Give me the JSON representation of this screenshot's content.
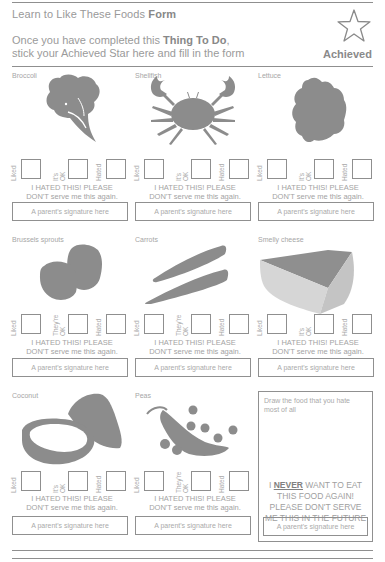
{
  "header": {
    "title_prefix": "Learn to Like These Foods",
    "title_bold": "Form",
    "instruction_line1_prefix": "Once you have completed this",
    "instruction_line1_bold": "Thing To Do",
    "instruction_line1_suffix": ",",
    "instruction_line2": "stick your Achieved Star here and fill in the form",
    "achieved_label": "Achieved",
    "star_icon": "star-outline-icon"
  },
  "common": {
    "liked_label": "Liked",
    "hated_label": "Hated",
    "hated_msg_line1": "I HATED THIS! PLEASE",
    "hated_msg_line2": "DON'T serve me this again.",
    "signature_placeholder": "A parent's signature here"
  },
  "foods": [
    {
      "name": "Broccoli",
      "ok_label_line1": "It's",
      "ok_label_line2": "OK",
      "image_icon": "broccoli-icon"
    },
    {
      "name": "Shellfish",
      "ok_label_line1": "It's",
      "ok_label_line2": "OK",
      "image_icon": "crab-icon"
    },
    {
      "name": "Lettuce",
      "ok_label_line1": "It's",
      "ok_label_line2": "OK",
      "image_icon": "lettuce-icon"
    },
    {
      "name": "Brussels sprouts",
      "ok_label_line1": "They're",
      "ok_label_line2": "OK",
      "image_icon": "brussels-sprouts-icon"
    },
    {
      "name": "Carrots",
      "ok_label_line1": "They're",
      "ok_label_line2": "OK",
      "image_icon": "carrots-icon"
    },
    {
      "name": "Smelly cheese",
      "ok_label_line1": "It's",
      "ok_label_line2": "OK",
      "image_icon": "cheese-icon"
    },
    {
      "name": "Coconut",
      "ok_label_line1": "It's",
      "ok_label_line2": "OK",
      "image_icon": "coconut-icon"
    },
    {
      "name": "Peas",
      "ok_label_line1": "They're",
      "ok_label_line2": "OK",
      "image_icon": "peas-icon"
    }
  ],
  "draw_panel": {
    "prompt": "Draw the food that you hate most of all",
    "never_prefix": "I",
    "never_bold": "NEVER",
    "never_rest_line1": "WANT TO EAT",
    "never_line2": "THIS FOOD AGAIN!",
    "never_line3": "PLEASE DON'T SERVE",
    "never_line4": "ME THIS IN THE FUTURE",
    "signature_placeholder": "A parent's signature here"
  }
}
